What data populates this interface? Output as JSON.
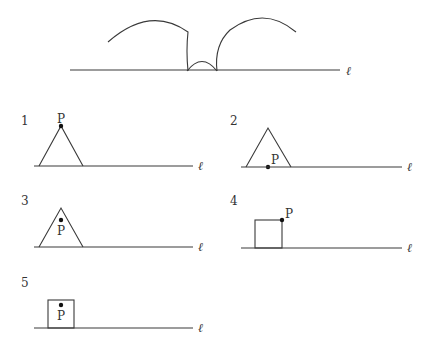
{
  "top_figure": {
    "line_label": "ℓ",
    "description": "Path traced by a point of a rolling figure along line ℓ"
  },
  "options": [
    {
      "number": "1",
      "shape": "triangle",
      "point_label": "P",
      "point_position": "top vertex",
      "line_label": "ℓ"
    },
    {
      "number": "2",
      "shape": "triangle",
      "point_label": "P",
      "point_position": "midpoint of base",
      "line_label": "ℓ"
    },
    {
      "number": "3",
      "shape": "triangle",
      "point_label": "P",
      "point_position": "interior",
      "line_label": "ℓ"
    },
    {
      "number": "4",
      "shape": "square",
      "point_label": "P",
      "point_position": "top-right vertex",
      "line_label": "ℓ"
    },
    {
      "number": "5",
      "shape": "square",
      "point_label": "P",
      "point_position": "interior",
      "line_label": "ℓ"
    }
  ]
}
